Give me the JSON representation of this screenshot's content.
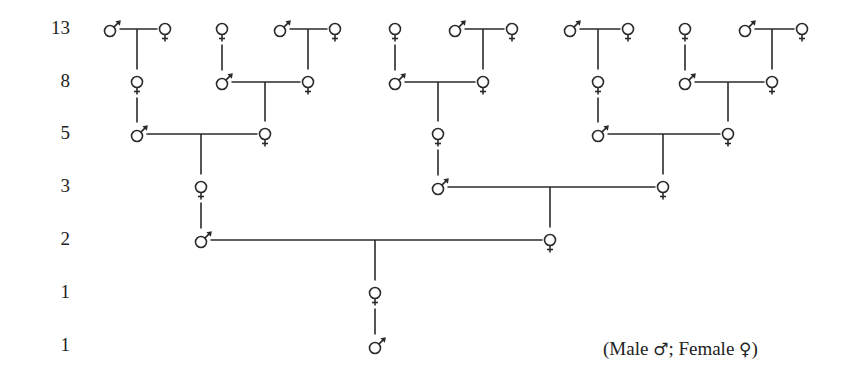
{
  "rows": [
    {
      "label": "13",
      "y": 29
    },
    {
      "label": "8",
      "y": 82
    },
    {
      "label": "5",
      "y": 134
    },
    {
      "label": "3",
      "y": 187
    },
    {
      "label": "2",
      "y": 240
    },
    {
      "label": "1",
      "y": 293
    },
    {
      "label": "1",
      "y": 346
    }
  ],
  "legend": {
    "open": "(Male",
    "male_symbol": "♂",
    "sep": "; Female",
    "female_symbol": "♀",
    "close": ")"
  },
  "nodes": [
    {
      "id": "g7m1",
      "sex": "male",
      "x": 110,
      "row": 0
    },
    {
      "id": "g7f1",
      "sex": "female",
      "x": 165,
      "row": 0
    },
    {
      "id": "g7f2",
      "sex": "female",
      "x": 222,
      "row": 0
    },
    {
      "id": "g7m2",
      "sex": "male",
      "x": 280,
      "row": 0
    },
    {
      "id": "g7f3",
      "sex": "female",
      "x": 335,
      "row": 0
    },
    {
      "id": "g7f4",
      "sex": "female",
      "x": 395,
      "row": 0
    },
    {
      "id": "g7m3",
      "sex": "male",
      "x": 455,
      "row": 0
    },
    {
      "id": "g7f5",
      "sex": "female",
      "x": 512,
      "row": 0
    },
    {
      "id": "g7m4",
      "sex": "male",
      "x": 570,
      "row": 0
    },
    {
      "id": "g7f6",
      "sex": "female",
      "x": 628,
      "row": 0
    },
    {
      "id": "g7f7",
      "sex": "female",
      "x": 685,
      "row": 0
    },
    {
      "id": "g7m5",
      "sex": "male",
      "x": 745,
      "row": 0
    },
    {
      "id": "g7f8",
      "sex": "female",
      "x": 802,
      "row": 0
    },
    {
      "id": "g6f1",
      "sex": "female",
      "x": 137,
      "row": 1
    },
    {
      "id": "g6m1",
      "sex": "male",
      "x": 222,
      "row": 1
    },
    {
      "id": "g6f2",
      "sex": "female",
      "x": 308,
      "row": 1
    },
    {
      "id": "g6m2",
      "sex": "male",
      "x": 395,
      "row": 1
    },
    {
      "id": "g6f3",
      "sex": "female",
      "x": 483,
      "row": 1
    },
    {
      "id": "g6f4",
      "sex": "female",
      "x": 598,
      "row": 1
    },
    {
      "id": "g6m3",
      "sex": "male",
      "x": 685,
      "row": 1
    },
    {
      "id": "g6f5",
      "sex": "female",
      "x": 772,
      "row": 1
    },
    {
      "id": "g5m1",
      "sex": "male",
      "x": 137,
      "row": 2
    },
    {
      "id": "g5f1",
      "sex": "female",
      "x": 265,
      "row": 2
    },
    {
      "id": "g5f2",
      "sex": "female",
      "x": 438,
      "row": 2
    },
    {
      "id": "g5m2",
      "sex": "male",
      "x": 598,
      "row": 2
    },
    {
      "id": "g5f3",
      "sex": "female",
      "x": 728,
      "row": 2
    },
    {
      "id": "g4f1",
      "sex": "female",
      "x": 201,
      "row": 3
    },
    {
      "id": "g4m1",
      "sex": "male",
      "x": 438,
      "row": 3
    },
    {
      "id": "g4f2",
      "sex": "female",
      "x": 663,
      "row": 3
    },
    {
      "id": "g3m1",
      "sex": "male",
      "x": 201,
      "row": 4
    },
    {
      "id": "g3f1",
      "sex": "female",
      "x": 550,
      "row": 4
    },
    {
      "id": "g2f1",
      "sex": "female",
      "x": 375,
      "row": 5
    },
    {
      "id": "g1m1",
      "sex": "male",
      "x": 375,
      "row": 6
    }
  ],
  "couples": [
    {
      "father": "g7m1",
      "mother": "g7f1",
      "child": "g6f1"
    },
    {
      "father": "g7m2",
      "mother": "g7f3",
      "child": "g6f2"
    },
    {
      "father": "g7m3",
      "mother": "g7f5",
      "child": "g6f3"
    },
    {
      "father": "g7m4",
      "mother": "g7f6",
      "child": "g6f4"
    },
    {
      "father": "g7m5",
      "mother": "g7f8",
      "child": "g6f5"
    },
    {
      "father": "g6m1",
      "mother": "g6f2",
      "child": "g5f1"
    },
    {
      "father": "g6m2",
      "mother": "g6f3",
      "child": "g5f2"
    },
    {
      "father": "g6m3",
      "mother": "g6f5",
      "child": "g5f3"
    },
    {
      "father": "g5m1",
      "mother": "g5f1",
      "child": "g4f1"
    },
    {
      "father": "g5m2",
      "mother": "g5f3",
      "child": "g4f2"
    },
    {
      "father": "g4m1",
      "mother": "g4f2",
      "child": "g3f1"
    },
    {
      "father": "g3m1",
      "mother": "g3f1",
      "child": "g2f1"
    }
  ],
  "single_parent_links": [
    {
      "parent": "g7f2",
      "child": "g6m1"
    },
    {
      "parent": "g7f4",
      "child": "g6m2"
    },
    {
      "parent": "g7f7",
      "child": "g6m3"
    },
    {
      "parent": "g6f1",
      "child": "g5m1"
    },
    {
      "parent": "g6f4",
      "child": "g5m2"
    },
    {
      "parent": "g5f2",
      "child": "g4m1"
    },
    {
      "parent": "g4f1",
      "child": "g3m1"
    },
    {
      "parent": "g2f1",
      "child": "g1m1"
    }
  ],
  "colors": {
    "line": "#2a2a2a",
    "text": "#222222",
    "background": "#ffffff"
  }
}
